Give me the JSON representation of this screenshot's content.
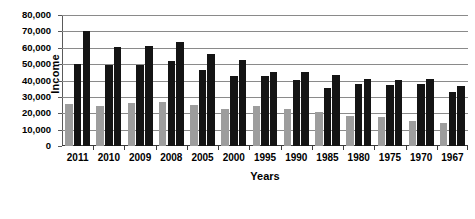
{
  "chart_data": {
    "type": "bar",
    "title": "",
    "xlabel": "Years",
    "ylabel": "Income",
    "ylim": [
      0,
      80000
    ],
    "yticks": [
      "0",
      "10,000",
      "20,000",
      "30,000",
      "40,000",
      "50,000",
      "60,000",
      "70,000",
      "80,000"
    ],
    "ytick_values": [
      0,
      10000,
      20000,
      30000,
      40000,
      50000,
      60000,
      70000,
      80000
    ],
    "grid": true,
    "legend": "none",
    "categories": [
      "2011",
      "2010",
      "2009",
      "2008",
      "2005",
      "2000",
      "1995",
      "1990",
      "1985",
      "1980",
      "1975",
      "1970",
      "1967"
    ],
    "series": [
      {
        "name": "series-1",
        "color": "#9d9d9d",
        "values": [
          25500,
          24500,
          26000,
          27000,
          25000,
          22500,
          24500,
          22500,
          20500,
          18500,
          17500,
          15500,
          14000
        ]
      },
      {
        "name": "series-2",
        "color": "#141414",
        "values": [
          50000,
          49500,
          49500,
          52000,
          46500,
          43000,
          42500,
          40500,
          35500,
          38000,
          37500,
          38000,
          33000
        ]
      },
      {
        "name": "series-3",
        "color": "#141414",
        "values": [
          70000,
          60500,
          61000,
          63500,
          56000,
          52500,
          45500,
          45000,
          43500,
          41000,
          40500,
          41000,
          36500
        ]
      }
    ]
  }
}
